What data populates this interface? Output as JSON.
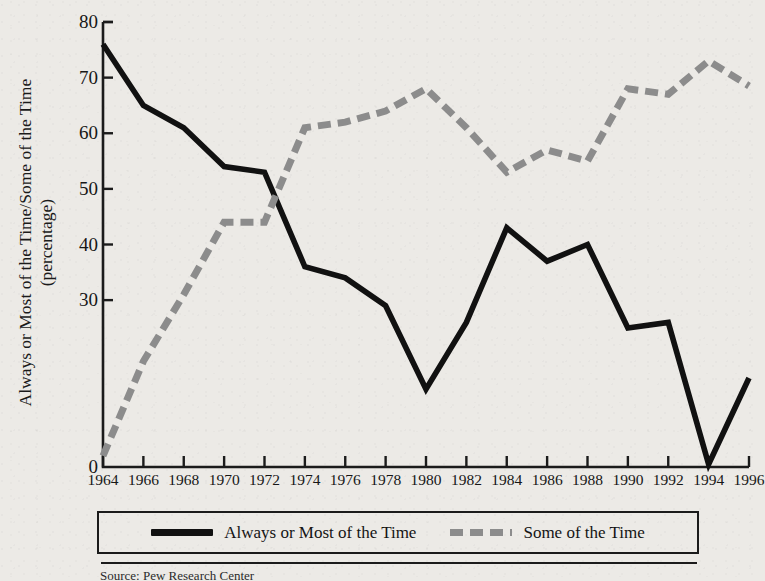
{
  "chart_data": {
    "type": "line",
    "title": "",
    "xlabel": "",
    "ylabel": "Always or Most of the Time/Some of the Time (percentage)",
    "ylabel_lines": [
      "Always or Most of the Time/Some of the Time",
      "(percentage)"
    ],
    "x": [
      1964,
      1966,
      1968,
      1970,
      1972,
      1974,
      1976,
      1978,
      1980,
      1982,
      1984,
      1986,
      1988,
      1990,
      1992,
      1994,
      1996
    ],
    "xticklabels": [
      "1964",
      "1966",
      "1968",
      "1970",
      "1972",
      "1974",
      "1976",
      "1978",
      "1980",
      "1982",
      "1984",
      "1986",
      "1988",
      "1990",
      "1992",
      "1994",
      "1996"
    ],
    "yticks": [
      0,
      30,
      40,
      50,
      60,
      70,
      80
    ],
    "yticklabels": [
      "0",
      "30",
      "40",
      "50",
      "60",
      "70",
      "80"
    ],
    "ylim": [
      0,
      80
    ],
    "xlim": [
      1964,
      1996
    ],
    "grid": false,
    "legend_position": "bottom",
    "series": [
      {
        "name": "Always or Most of the Time",
        "style": "solid",
        "color": "#111111",
        "values": [
          76,
          65,
          61,
          54,
          53,
          36,
          34,
          29,
          14,
          26,
          43,
          37,
          40,
          25,
          26,
          0.5,
          16
        ]
      },
      {
        "name": "Some of the Time",
        "style": "dashed",
        "color": "#8c8c8c",
        "values": [
          2,
          19,
          31,
          44,
          44,
          61,
          62,
          64,
          68,
          61,
          53,
          57,
          55,
          68,
          67,
          73,
          68.5
        ]
      }
    ]
  },
  "legend": {
    "entries": [
      {
        "label": "Always or Most of the Time",
        "style": "solid"
      },
      {
        "label": "Some of the Time",
        "style": "dashed"
      }
    ]
  },
  "footnote": {
    "text": "Source: Pew Research Center"
  }
}
